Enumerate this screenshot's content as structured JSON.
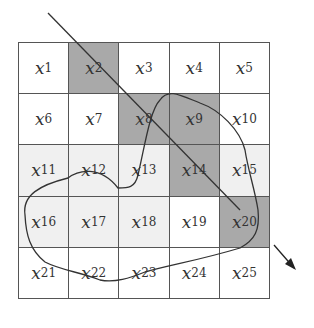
{
  "diagram": {
    "rows": 5,
    "cols": 5,
    "cells": [
      {
        "label": "x",
        "sub": "1",
        "fill": "white"
      },
      {
        "label": "x",
        "sub": "2",
        "fill": "dark"
      },
      {
        "label": "x",
        "sub": "3",
        "fill": "white"
      },
      {
        "label": "x",
        "sub": "4",
        "fill": "white"
      },
      {
        "label": "x",
        "sub": "5",
        "fill": "white"
      },
      {
        "label": "x",
        "sub": "6",
        "fill": "white"
      },
      {
        "label": "x",
        "sub": "7",
        "fill": "white"
      },
      {
        "label": "x",
        "sub": "8",
        "fill": "dark"
      },
      {
        "label": "x",
        "sub": "9",
        "fill": "dark"
      },
      {
        "label": "x",
        "sub": "10",
        "fill": "white"
      },
      {
        "label": "x",
        "sub": "11",
        "fill": "light"
      },
      {
        "label": "x",
        "sub": "12",
        "fill": "light"
      },
      {
        "label": "x",
        "sub": "13",
        "fill": "light"
      },
      {
        "label": "x",
        "sub": "14",
        "fill": "dark"
      },
      {
        "label": "x",
        "sub": "15",
        "fill": "light"
      },
      {
        "label": "x",
        "sub": "16",
        "fill": "light"
      },
      {
        "label": "x",
        "sub": "17",
        "fill": "light"
      },
      {
        "label": "x",
        "sub": "18",
        "fill": "light"
      },
      {
        "label": "x",
        "sub": "19",
        "fill": "white"
      },
      {
        "label": "x",
        "sub": "20",
        "fill": "dark"
      },
      {
        "label": "x",
        "sub": "21",
        "fill": "white"
      },
      {
        "label": "x",
        "sub": "22",
        "fill": "white"
      },
      {
        "label": "x",
        "sub": "23",
        "fill": "white"
      },
      {
        "label": "x",
        "sub": "24",
        "fill": "white"
      },
      {
        "label": "x",
        "sub": "25",
        "fill": "white"
      }
    ],
    "colors": {
      "dark": "#a9a9a9",
      "light": "#f0f0f0",
      "white": "#ffffff",
      "line": "#333333"
    },
    "path_description": "Diagonal line entering at top-left through x2, x8, x14, x20 ending with arrow; closed blob region covering x7..x20"
  }
}
